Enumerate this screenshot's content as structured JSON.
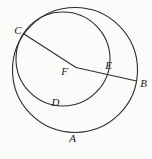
{
  "figure": {
    "background_color": "#fbfbf9",
    "line_color": "#2d2d2d",
    "label_color": "#1e1e1e",
    "labels": {
      "A": "A",
      "B": "B",
      "C": "C",
      "D": "D",
      "E": "E",
      "F": "F"
    },
    "geometry": {
      "outer_circle": {
        "cx": 75,
        "cy": 70,
        "r": 62.5
      },
      "inner_circle": {
        "cx": 63,
        "cy": 59,
        "r": 47
      },
      "segment_cf": {
        "x1": 24,
        "y1": 34,
        "x2": 76,
        "y2": 67.5
      },
      "segment_fb": {
        "x1": 76,
        "y1": 67.5,
        "x2": 136.5,
        "y2": 81
      },
      "points": {
        "A": {
          "x": 72,
          "y": 133,
          "on": "outer-circle"
        },
        "B": {
          "x": 136.5,
          "y": 81,
          "on": "outer-circle"
        },
        "C": {
          "x": 24,
          "y": 34,
          "on": "tangency-of-both-circles"
        },
        "D": {
          "x": 55,
          "y": 105,
          "on": "inner-circle"
        },
        "E": {
          "x": 107.5,
          "y": 74,
          "on": "inner-circle-segment-fb"
        },
        "F": {
          "x": 76,
          "y": 67.5,
          "on": "center-of-outer-circle"
        }
      }
    }
  }
}
